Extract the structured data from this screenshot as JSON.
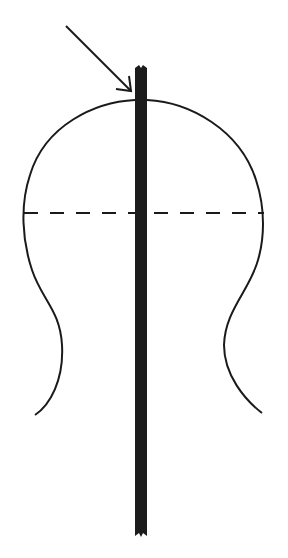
{
  "diagram": {
    "colors": {
      "stroke": "#1a1a1a",
      "rod": "#1c1c1c",
      "background": "#ffffff"
    },
    "elements": {
      "rod": {
        "x": 135,
        "y_top": 65,
        "y_bottom": 538,
        "width": 12
      },
      "arrow": {
        "from": [
          66,
          25
        ],
        "to": [
          133,
          92
        ]
      },
      "dashed_line": {
        "y": 213,
        "x_start": 24,
        "x_end": 264
      },
      "outline": "head-and-neck silhouette"
    }
  }
}
